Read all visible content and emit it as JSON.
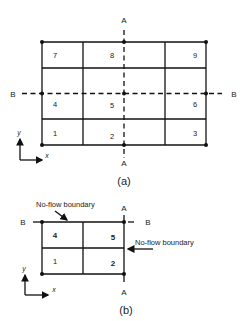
{
  "figure_a": {
    "caption": "(a)",
    "section_labels": {
      "A_top": "A",
      "A_bottom": "A",
      "B_left": "B",
      "B_right": "B"
    },
    "cells": [
      "1",
      "2",
      "3",
      "4",
      "5",
      "6",
      "7",
      "8",
      "9"
    ],
    "axes": {
      "x": "x",
      "y": "y"
    }
  },
  "figure_b": {
    "caption": "(b)",
    "section_labels": {
      "A_top": "A",
      "A_bottom": "A",
      "B_left": "B",
      "B_right": "B"
    },
    "cells": [
      "1",
      "2",
      "4",
      "5"
    ],
    "annotations": {
      "top_boundary": "No-flow boundary",
      "right_boundary": "No-flow boundary"
    },
    "axes": {
      "x": "x",
      "y": "y"
    }
  },
  "colors": {
    "line": "#111111",
    "text": "#222222",
    "background": "#ffffff"
  }
}
